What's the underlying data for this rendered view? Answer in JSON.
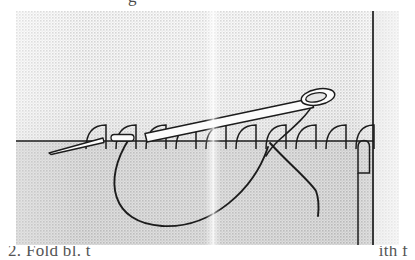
{
  "figure": {
    "kind": "scanned-book-illustration",
    "caption_top_fragment": "g",
    "caption_bottom_left_fragment": "2. Fold bl. t",
    "caption_bottom_right_fragment": "ith f",
    "page_fold_present": "yes"
  },
  "colors": {
    "ink": "#1c1c1c",
    "paper": "#ffffff",
    "panel_light": "#e3e3e3",
    "panel_mid": "#d0d0d0",
    "panel_dark": "#c2c2c2",
    "panel_edge": "#eeeeee",
    "needle_fill": "#fafafa"
  },
  "panel": {
    "x": 16,
    "y": 11,
    "width": 383,
    "height": 234,
    "texture": "halftone-dither-gray"
  },
  "fabric_edge_line": {
    "name": "horizontal-fabric-edge",
    "y": 130,
    "x_start": 0,
    "x_end": 383,
    "stroke_width": 1.6
  },
  "right_vertical_line": {
    "name": "fabric-right-edge",
    "x": 357,
    "y_start": 0,
    "y_end": 234,
    "stroke_width": 1.6
  },
  "selvage_tab": {
    "name": "fabric-corner-tab",
    "x": 342,
    "y": 130,
    "width": 11,
    "height": 32
  },
  "stitches": {
    "name": "blanket-stitch-arches",
    "count": 10,
    "arch_width": 20,
    "arch_height": 16,
    "centers_x": [
      80,
      110,
      140,
      170,
      200,
      230,
      260,
      290,
      320,
      348
    ],
    "baseline_y": 130
  },
  "needle": {
    "name": "sewing-needle",
    "tail_x": 128,
    "tail_y": 118,
    "tip_x": 311,
    "tip_y": 80,
    "body_width": 8,
    "eye_cx": 303,
    "eye_cy": 83,
    "eye_rx": 15,
    "eye_ry": 7.5,
    "eye_angle_deg": -12
  },
  "second_needle": {
    "name": "needle-point-fragment-left",
    "x1": 34,
    "y1": 140,
    "x2": 88,
    "y2": 128
  },
  "small_segment": {
    "name": "thread-segment-left",
    "x": 96,
    "y": 125,
    "width": 22,
    "height": 7
  },
  "thread_loop": {
    "name": "thread-loop-curve",
    "start_x": 117,
    "start_y": 130,
    "bottom_y": 212,
    "end_x": 258,
    "end_y": 130
  },
  "thread_tail": {
    "name": "thread-tail",
    "start_x": 258,
    "start_y": 130,
    "bend_x": 300,
    "bend_y": 178,
    "end_x": 303,
    "end_y": 204
  },
  "thread_through_eye": {
    "name": "thread-through-needle-eye",
    "top_x": 300,
    "top_y": 86,
    "bottom_x": 259,
    "bottom_y": 132
  }
}
